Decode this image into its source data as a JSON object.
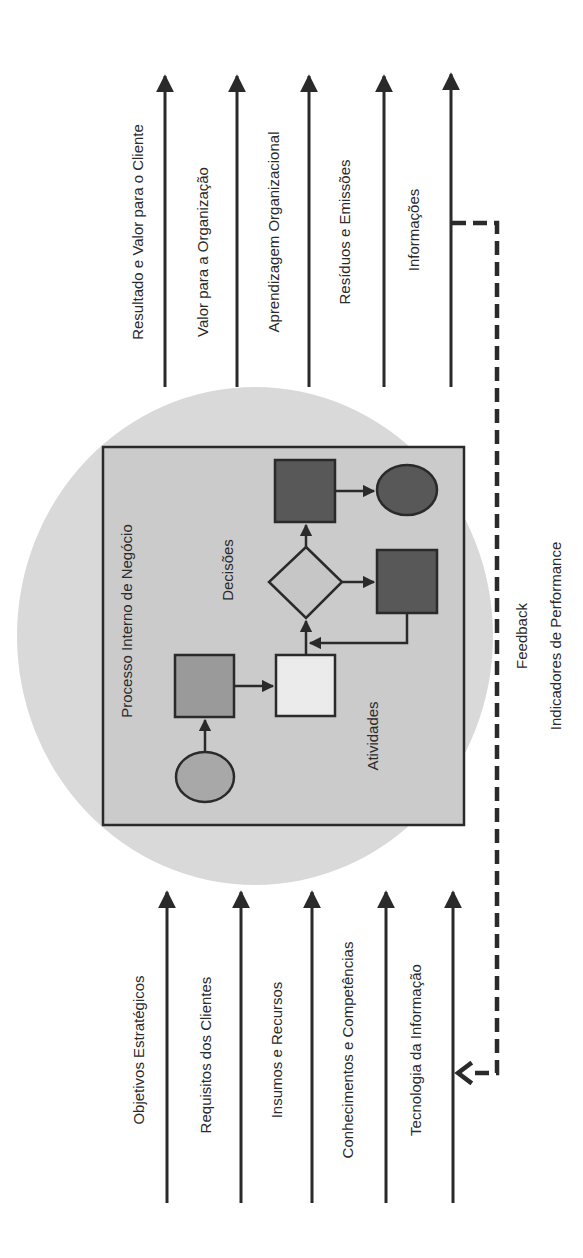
{
  "diagram": {
    "orientation": "rotated -90deg (text reads bottom-to-top)",
    "colors": {
      "background": "#ffffff",
      "ellipse": "#d9d9d9",
      "process_box": "#cbcbcb",
      "stroke": "#2a2a2a",
      "dark_shape": "#585858",
      "medium_shape": "#9a9a9a",
      "light_shape": "#ebebeb",
      "diamond": "#c6c6c6",
      "start_circle": "#a8a8a8"
    },
    "outputs": [
      {
        "label": "Resultado e Valor para o Cliente"
      },
      {
        "label": "Valor para a Organização"
      },
      {
        "label": "Aprendizagem Organizacional"
      },
      {
        "label": "Resíduos e Emissões"
      },
      {
        "label": "Informações"
      }
    ],
    "inputs": [
      {
        "label": "Objetivos Estratégicos"
      },
      {
        "label": "Requisitos dos Clientes"
      },
      {
        "label": "Insumos e Recursos"
      },
      {
        "label": "Conhecimentos e Competências"
      },
      {
        "label": "Tecnologia da Informação"
      }
    ],
    "process": {
      "title": "Processo Interno de Negócio",
      "activities_label": "Atividades",
      "decisions_label": "Decisões"
    },
    "feedback": {
      "label": "Feedback",
      "sublabel": "Indicadores de Performance"
    }
  }
}
